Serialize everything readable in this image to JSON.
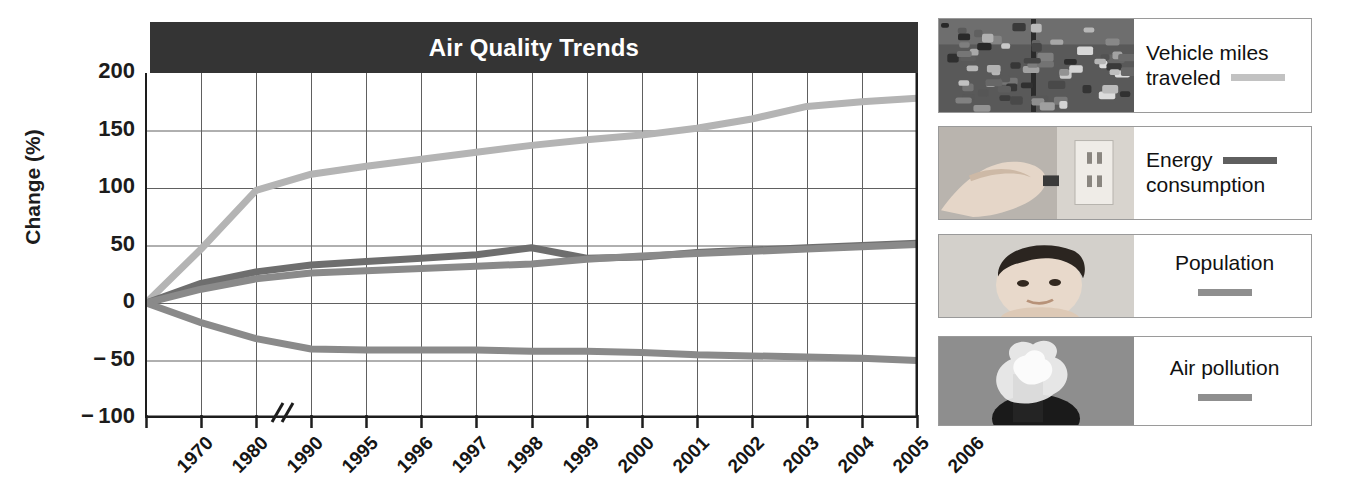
{
  "chart": {
    "title": "Air Quality Trends",
    "title_bar_color": "#343434",
    "y_axis_title": "Change (%)",
    "axis_break_symbol": "//"
  },
  "chart_data": {
    "type": "line",
    "title": "Air Quality Trends",
    "xlabel": "",
    "ylabel": "Change (%)",
    "ylim": [
      -100,
      200
    ],
    "yticks": [
      200,
      150,
      100,
      50,
      0,
      -50,
      -100
    ],
    "ytick_labels": [
      "200",
      "150",
      "100",
      "50",
      "0",
      "− 50",
      "− 100"
    ],
    "grid": true,
    "legend_position": "right",
    "axis_break_after_category": "1990",
    "categories": [
      "1970",
      "1980",
      "1990",
      "1995",
      "1996",
      "1997",
      "1998",
      "1999",
      "2000",
      "2001",
      "2002",
      "2003",
      "2004",
      "2005",
      "2006"
    ],
    "series": [
      {
        "name": "Vehicle miles traveled",
        "color": "#b4b4b4",
        "values": [
          0,
          47,
          98,
          112,
          119,
          125,
          131,
          137,
          142,
          146,
          152,
          160,
          171,
          175,
          178
        ]
      },
      {
        "name": "Energy consumption",
        "color": "#6e6e6e",
        "values": [
          0,
          17,
          27,
          33,
          36,
          39,
          42,
          48,
          39,
          40,
          44,
          46,
          48,
          50,
          52
        ]
      },
      {
        "name": "Population",
        "color": "#8a8a8a",
        "values": [
          0,
          12,
          21,
          26,
          28,
          30,
          32,
          34,
          38,
          41,
          43,
          45,
          47,
          49,
          51
        ]
      },
      {
        "name": "Air pollution",
        "color": "#8a8a8a",
        "values": [
          0,
          -17,
          -31,
          -40,
          -41,
          -41,
          -41,
          -42,
          -42,
          -43,
          -45,
          -46,
          -47,
          -48,
          -50
        ]
      }
    ]
  },
  "legend": {
    "items": [
      {
        "label_line1": "Vehicle miles",
        "label_line2": "traveled",
        "swatch_color": "#c2c2c2",
        "swatch_placement": "inline",
        "thumbnail_name": "traffic-congestion-photo"
      },
      {
        "label_line1": "Energy",
        "label_line2": "consumption",
        "swatch_color": "#5f5f5f",
        "swatch_placement": "inline",
        "thumbnail_name": "electrical-outlet-photo"
      },
      {
        "label_line1": "Population",
        "label_line2": "",
        "swatch_color": "#8f8f8f",
        "swatch_placement": "below",
        "thumbnail_name": "baby-portrait-photo"
      },
      {
        "label_line1": "Air pollution",
        "label_line2": "",
        "swatch_color": "#8f8f8f",
        "swatch_placement": "below",
        "thumbnail_name": "smokestack-photo"
      }
    ]
  }
}
